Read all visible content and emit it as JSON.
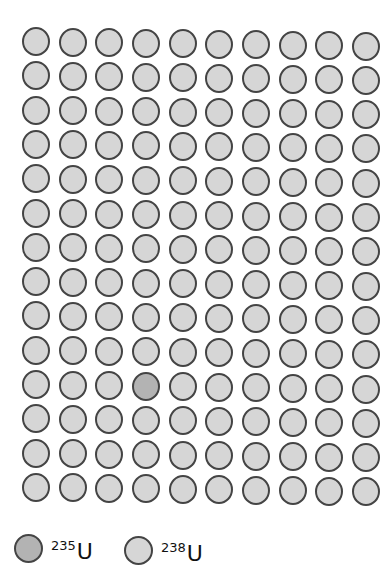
{
  "diagram": {
    "grid": {
      "rows": 14,
      "cols": 10,
      "origin_x": 36,
      "origin_y": 41,
      "spacing_x": 36.8,
      "spacing_y": 34.3,
      "highlight": [
        {
          "row": 10,
          "col": 3,
          "type": "u235"
        }
      ]
    },
    "colors": {
      "u235_fill": "#b3b3b3",
      "u238_fill": "#d6d6d6",
      "outline": "#444444"
    },
    "legend": [
      {
        "isotope": "u235",
        "mass": "235",
        "symbol": "U"
      },
      {
        "isotope": "u238",
        "mass": "238",
        "symbol": "U"
      }
    ]
  }
}
